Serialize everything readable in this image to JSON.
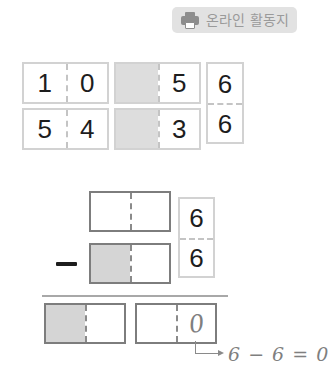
{
  "badge": {
    "label": "온라인 활동지",
    "icon": "printer-icon",
    "background_color": "#e2e2e2",
    "text_color": "#9a9a9a"
  },
  "worksheet": {
    "type": "place-value-subtraction",
    "top_section": {
      "row1": {
        "box_a": {
          "left": "1",
          "right": "0",
          "left_shaded": false
        },
        "box_b": {
          "left": "",
          "right": "5",
          "left_shaded": true
        },
        "stack_top": "6"
      },
      "row2": {
        "box_a": {
          "left": "5",
          "right": "4",
          "left_shaded": false
        },
        "box_b": {
          "left": "",
          "right": "3",
          "left_shaded": true
        },
        "stack_bottom": "6"
      }
    },
    "bottom_section": {
      "minuend": {
        "left": "",
        "right": "",
        "left_shaded": false
      },
      "operator": "−",
      "subtrahend": {
        "left": "",
        "right": "",
        "left_shaded": true
      },
      "stack_top": "6",
      "stack_bottom": "6",
      "answer_box_a": {
        "left": "",
        "right": "",
        "left_shaded": true
      },
      "answer_box_b": {
        "left": "",
        "right": "0",
        "left_shaded": false
      }
    },
    "annotation": {
      "text": "6 − 6 = 0",
      "color": "#7f7f7f"
    }
  }
}
